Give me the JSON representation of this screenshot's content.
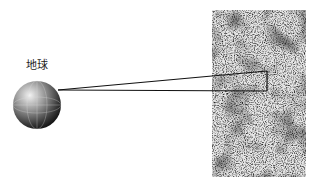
{
  "diagram": {
    "earth_label": "地球",
    "earth": {
      "cx": 37,
      "cy": 105,
      "r": 24
    },
    "texture_region": {
      "x": 212,
      "y": 10,
      "width": 94,
      "height": 167
    },
    "projection": {
      "apex": [
        61,
        90
      ],
      "rect": {
        "x1": 267,
        "y_top": 71,
        "y_bottom": 91
      }
    }
  }
}
